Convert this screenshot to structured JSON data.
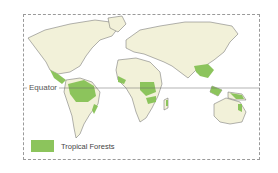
{
  "map": {
    "land_color": "#f2f1d9",
    "forest_color": "#8cc45c",
    "outline_color": "#555555",
    "equator_label": "Equator",
    "legend": [
      {
        "label": "Tropical Forests",
        "color": "#8cc45c"
      }
    ],
    "forest_regions": [
      "Central America",
      "Amazon Basin",
      "Atlantic coast of Brazil",
      "West Africa",
      "Congo Basin",
      "Madagascar east coast",
      "India west coast",
      "Southeast Asia",
      "Indonesia",
      "New Guinea",
      "Northeast Australia"
    ]
  }
}
